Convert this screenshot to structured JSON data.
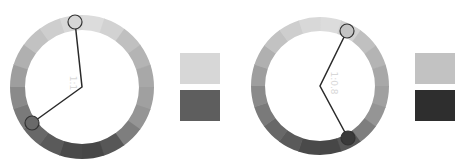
{
  "panels": [
    {
      "id": "left",
      "center_label": "1:1",
      "wheel": {
        "cx": 82,
        "cy": 87,
        "r_outer": 72,
        "r_inner": 57
      },
      "handles": [
        {
          "name": "light-color-handle",
          "x": 75,
          "y": 22,
          "fill": "#d6d6d6"
        },
        {
          "name": "dark-color-handle",
          "x": 32,
          "y": 123,
          "fill": "#6a6a6a"
        }
      ],
      "swatches": [
        {
          "name": "light-swatch",
          "x": 180,
          "y": 53,
          "color": "#d7d7d7"
        },
        {
          "name": "dark-swatch",
          "x": 180,
          "y": 90,
          "color": "#5e5e5e"
        }
      ]
    },
    {
      "id": "right",
      "center_label": "1:0.8",
      "wheel": {
        "cx": 320,
        "cy": 86,
        "r_outer": 69,
        "r_inner": 55
      },
      "handles": [
        {
          "name": "light-color-handle",
          "x": 347,
          "y": 31,
          "fill": "#c4c4c4"
        },
        {
          "name": "dark-color-handle",
          "x": 348,
          "y": 138,
          "fill": "#3a3a3a"
        }
      ],
      "swatches": [
        {
          "name": "light-swatch",
          "x": 415,
          "y": 53,
          "color": "#c2c2c2"
        },
        {
          "name": "dark-swatch",
          "x": 415,
          "y": 90,
          "color": "#2e2e2e"
        }
      ]
    }
  ],
  "ring_colors": [
    "#dcdcdc",
    "#d2d2d2",
    "#c0c0c0",
    "#b4b4b4",
    "#a8a8a8",
    "#a0a0a0",
    "#959595",
    "#7e7e7e",
    "#575757",
    "#474747",
    "#4a4a4a",
    "#5a5a5a",
    "#686868",
    "#7a7a7a",
    "#8a8a8a",
    "#9e9e9e",
    "#b0b0b0",
    "#c2c2c2",
    "#cecece",
    "#d8d8d8"
  ]
}
